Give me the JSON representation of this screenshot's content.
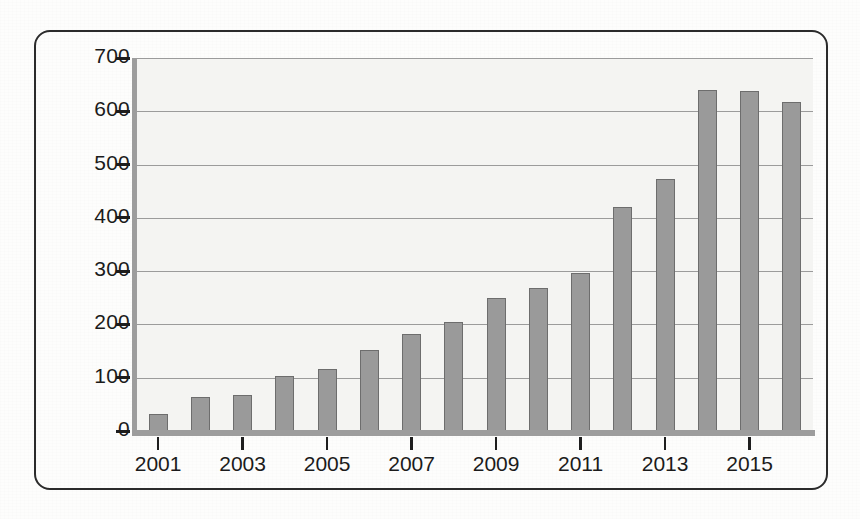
{
  "document": {
    "type": "scanned-page-figure",
    "frame_color": "#2b2b2b",
    "paper_color": "#fdfdfc"
  },
  "chart_data": {
    "type": "bar",
    "title": "",
    "subtitle": "",
    "xlabel": "",
    "ylabel": "",
    "categories": [
      "2001",
      "2002",
      "2003",
      "2004",
      "2005",
      "2006",
      "2007",
      "2008",
      "2009",
      "2010",
      "2011",
      "2012",
      "2013",
      "2014",
      "2015",
      "2016"
    ],
    "values": [
      32,
      64,
      68,
      104,
      117,
      153,
      182,
      204,
      250,
      269,
      296,
      421,
      473,
      640,
      639,
      618
    ],
    "ylim": [
      0,
      700
    ],
    "ytick_values": [
      0,
      100,
      200,
      300,
      400,
      500,
      600,
      700
    ],
    "ytick_labels": [
      "0",
      "100",
      "200",
      "300",
      "400",
      "500",
      "600",
      "700"
    ],
    "xtick_labels": [
      "2001",
      "2003",
      "2005",
      "2007",
      "2009",
      "2011",
      "2013",
      "2015"
    ],
    "xtick_categories": [
      "2001",
      "2003",
      "2005",
      "2007",
      "2009",
      "2011",
      "2013",
      "2015"
    ],
    "grid": true,
    "grid_axis": "y",
    "legend": false,
    "legend_position": "none",
    "bar_color": "#9a9a9a",
    "bar_edge_color": "#6d6d6d",
    "grid_color": "#9b9b9b",
    "axis_color": "#9d9d9d",
    "plot_background": "#f4f4f2"
  },
  "ghost_text": {
    "lines": [
      "the faint impression of text bleeding",
      "through from the reverse of the page",
      "is visible but not legible",
      "in the scanned figure area"
    ]
  }
}
